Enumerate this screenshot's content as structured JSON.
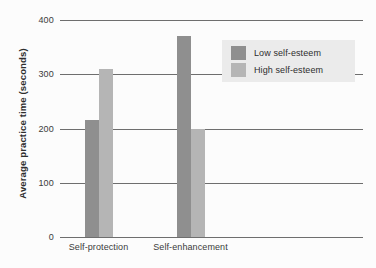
{
  "chart_data": {
    "type": "bar",
    "title": "",
    "subtitle": "",
    "xlabel": "",
    "ylabel": "Average practice time (seconds)",
    "categories": [
      "Self-protection",
      "Self-enhancement"
    ],
    "series": [
      {
        "name": "Low self-esteem",
        "color": "#8f8f8f",
        "values": [
          216,
          370
        ]
      },
      {
        "name": "High self-esteem",
        "color": "#b5b5b5",
        "values": [
          310,
          200
        ]
      }
    ],
    "ylim": [
      0,
      400
    ],
    "ytick_labels": [
      "400",
      "300",
      "200",
      "100",
      "0"
    ],
    "ytick_values": [
      400,
      300,
      200,
      100,
      0
    ],
    "grid": "horizontal",
    "legend_position": "top-right",
    "legend_background": "#ebebeb",
    "background": "#fcfcfc",
    "axis_color": "#6e6e6e"
  }
}
